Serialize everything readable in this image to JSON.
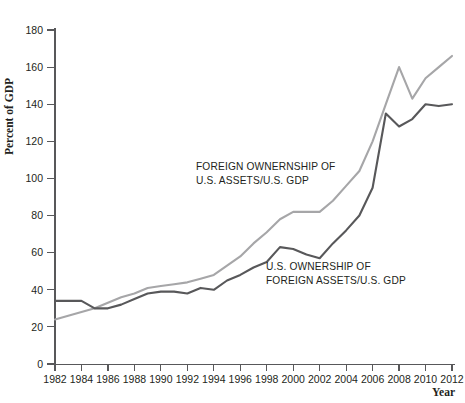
{
  "chart_data": {
    "type": "line",
    "title": "",
    "xlabel": "Year",
    "ylabel": "Percent of GDP",
    "xlim": [
      1982,
      2012
    ],
    "ylim": [
      0,
      180
    ],
    "ytick_step": 20,
    "xtick_step": 2,
    "grid": false,
    "legend_position": "inline-annotation",
    "ytick_labels": [
      "0",
      "20",
      "40",
      "60",
      "80",
      "100",
      "120",
      "140",
      "160",
      "180"
    ],
    "ytick_values": [
      0,
      20,
      40,
      60,
      80,
      100,
      120,
      140,
      160,
      180
    ],
    "xtick_labels": [
      "1982",
      "1984",
      "1986",
      "1988",
      "1990",
      "1992",
      "1994",
      "1996",
      "1998",
      "2000",
      "2002",
      "2004",
      "2006",
      "2008",
      "2010",
      "2012"
    ],
    "xtick_values": [
      1982,
      1984,
      1986,
      1988,
      1990,
      1992,
      1994,
      1996,
      1998,
      2000,
      2002,
      2004,
      2006,
      2008,
      2010,
      2012
    ],
    "x": [
      1982,
      1983,
      1984,
      1985,
      1986,
      1987,
      1988,
      1989,
      1990,
      1991,
      1992,
      1993,
      1994,
      1995,
      1996,
      1997,
      1998,
      1999,
      2000,
      2001,
      2002,
      2003,
      2004,
      2005,
      2006,
      2007,
      2008,
      2009,
      2010,
      2011,
      2012
    ],
    "series": [
      {
        "name": "Foreign ownership of U.S. assets / U.S. GDP",
        "color": "#a6a6a8",
        "values": [
          24,
          26,
          28,
          30,
          33,
          36,
          38,
          41,
          42,
          43,
          44,
          46,
          48,
          53,
          58,
          65,
          71,
          78,
          82,
          82,
          82,
          88,
          96,
          104,
          120,
          140,
          160,
          143,
          154,
          160,
          166
        ]
      },
      {
        "name": "U.S. ownership of foreign assets / U.S. GDP",
        "color": "#58585a",
        "values": [
          34,
          34,
          34,
          30,
          30,
          32,
          35,
          38,
          39,
          39,
          38,
          41,
          40,
          45,
          48,
          52,
          55,
          63,
          62,
          59,
          57,
          65,
          72,
          80,
          95,
          135,
          128,
          132,
          140,
          139,
          140
        ]
      }
    ],
    "annotations": [
      {
        "id": "foreign-ownership-label",
        "lines": [
          "FOREIGN OWNERNSHIP OF",
          "U.S. ASSETS/U.S. GDP"
        ],
        "x": 196,
        "y": 170
      },
      {
        "id": "us-ownership-label",
        "lines": [
          "U.S. OWNERSHIP OF",
          "FOREIGN ASSETS/U.S. GDP"
        ],
        "x": 266,
        "y": 270
      }
    ]
  }
}
